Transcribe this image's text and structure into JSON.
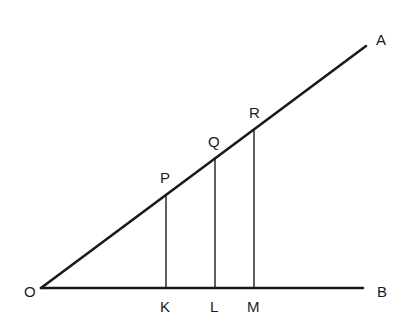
{
  "diagram": {
    "title": "",
    "colors": {
      "stroke": "#1a1a1a",
      "background": "#ffffff"
    },
    "points": {
      "O": {
        "label": "O",
        "x": 41,
        "y": 288
      },
      "A": {
        "label": "A",
        "x": 366,
        "y": 46
      },
      "B": {
        "label": "B",
        "x": 363,
        "y": 288
      },
      "P": {
        "label": "P",
        "x": 166,
        "y": 196
      },
      "Q": {
        "label": "Q",
        "x": 215,
        "y": 159
      },
      "R": {
        "label": "R",
        "x": 254,
        "y": 130
      },
      "K": {
        "label": "K",
        "x": 166,
        "y": 288
      },
      "L": {
        "label": "L",
        "x": 215,
        "y": 288
      },
      "M": {
        "label": "M",
        "x": 254,
        "y": 288
      }
    },
    "segments": [
      {
        "from": "O",
        "to": "A",
        "weight": "thick"
      },
      {
        "from": "O",
        "to": "B",
        "weight": "thick"
      },
      {
        "from": "P",
        "to": "K",
        "weight": "thin"
      },
      {
        "from": "Q",
        "to": "L",
        "weight": "thin"
      },
      {
        "from": "R",
        "to": "M",
        "weight": "thin"
      }
    ],
    "labels": {
      "O": "O",
      "A": "A",
      "B": "B",
      "P": "P",
      "Q": "Q",
      "R": "R",
      "K": "K",
      "L": "L",
      "M": "M"
    }
  }
}
